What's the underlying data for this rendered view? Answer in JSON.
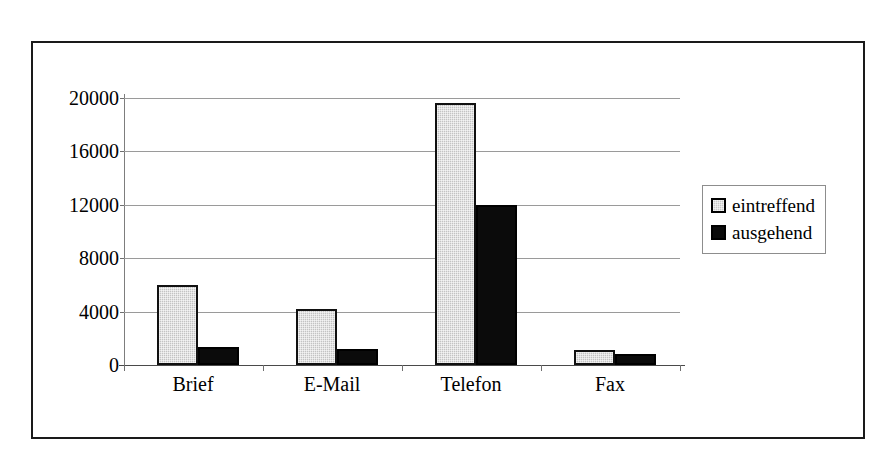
{
  "chart_data": {
    "type": "bar",
    "title": "",
    "subtitle": "",
    "xlabel": "",
    "ylabel": "",
    "categories": [
      "Brief",
      "E-Mail",
      "Telefon",
      "Fax"
    ],
    "series": [
      {
        "name": "eintreffend",
        "color": "#c3c3c3",
        "values": [
          6000,
          4200,
          19600,
          1100
        ]
      },
      {
        "name": "ausgehend",
        "color": "#0b0b0b",
        "values": [
          1340,
          1200,
          12000,
          820
        ]
      }
    ],
    "ylim": [
      0,
      20000
    ],
    "yticks": [
      0,
      4000,
      8000,
      12000,
      16000,
      20000
    ],
    "ytick_labels": [
      "0",
      "4000",
      "8000",
      "12000",
      "16000",
      "20000"
    ],
    "grid": true,
    "grid_axis": "y",
    "legend_position": "right",
    "frame": true
  },
  "legend": {
    "items": [
      {
        "label": "eintreffend",
        "swatch": "light-gray-square-icon"
      },
      {
        "label": "ausgehend",
        "swatch": "black-square-icon"
      }
    ]
  },
  "axes": {
    "y_tick_labels": [
      "20000",
      "16000",
      "12000",
      "8000",
      "4000",
      "0"
    ],
    "x_tick_labels": [
      "Brief",
      "E-Mail",
      "Telefon",
      "Fax"
    ]
  }
}
